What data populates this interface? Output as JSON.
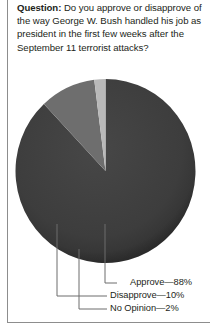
{
  "question": {
    "label": "Question:",
    "text": " Do you approve or disapprove of the way George W. Bush handled his job as president in the first few weeks after the September 11 terrorist attacks?"
  },
  "chart_data": {
    "type": "pie",
    "title": "",
    "categories": [
      "Approve",
      "Disapprove",
      "No Opinion"
    ],
    "values": [
      88,
      10,
      2
    ],
    "value_suffix": "%",
    "labels": [
      "Approve—88%",
      "Disapprove—10%",
      "No Opinion—2%"
    ],
    "colors": [
      "#3d3d3d",
      "#6e6e6e",
      "#b9b9b9"
    ],
    "legend_position": "bottom-right",
    "leader_lines": true,
    "grid": false
  },
  "legend": {
    "items": [
      {
        "label": "Approve—88%",
        "color": "#3d3d3d"
      },
      {
        "label": "Disapprove—10%",
        "color": "#6e6e6e"
      },
      {
        "label": "No Opinion—2%",
        "color": "#b9b9b9"
      }
    ]
  }
}
